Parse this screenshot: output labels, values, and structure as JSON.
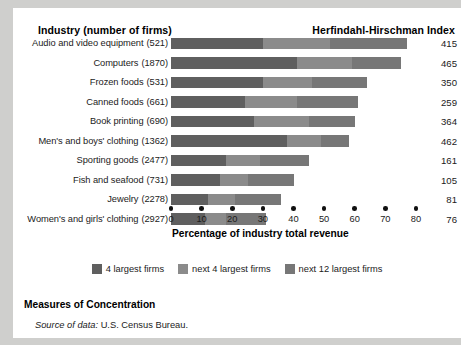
{
  "header": {
    "left_title": "Industry (number of firms)",
    "right_title": "Herfindahl-Hirschman Index"
  },
  "footer": {
    "title": "Measures of Concentration",
    "source_label": "Source of data:",
    "source_value": "U.S. Census Bureau."
  },
  "legend": [
    {
      "label": "4 largest firms",
      "swatch": "s1",
      "color": "#5f5f5f"
    },
    {
      "label": "next 4 largest firms",
      "swatch": "s2",
      "color": "#8b8b8b"
    },
    {
      "label": "next 12 largest firms",
      "swatch": "s3",
      "color": "#777777"
    }
  ],
  "chart_data": {
    "type": "bar",
    "orientation": "horizontal",
    "stacked": true,
    "title": "",
    "xlabel": "Percentage of industry total revenue",
    "ylabel": "",
    "xlim": [
      0,
      80
    ],
    "xticks": [
      0,
      10,
      20,
      30,
      40,
      50,
      60,
      70,
      80
    ],
    "grid": false,
    "legend_position": "bottom-center",
    "categories": [
      "Audio and video equipment",
      "Computers",
      "Frozen foods",
      "Canned foods",
      "Book printing",
      "Men's and boys' clothing",
      "Sporting goods",
      "Fish and seafood",
      "Jewelry",
      "Women's and girls' clothing"
    ],
    "firm_counts": [
      521,
      1870,
      531,
      661,
      690,
      1362,
      2477,
      731,
      2278,
      2927
    ],
    "series": [
      {
        "name": "4 largest firms",
        "values": [
          30,
          41,
          30,
          24,
          27,
          38,
          18,
          16,
          12,
          11
        ]
      },
      {
        "name": "next 4 largest firms",
        "values": [
          22,
          18,
          16,
          17,
          18,
          11,
          11,
          9,
          9,
          7
        ]
      },
      {
        "name": "next 12 largest firms",
        "values": [
          25,
          16,
          18,
          20,
          15,
          9,
          16,
          15,
          15,
          13
        ]
      }
    ],
    "totals": [
      77,
      75,
      64,
      61,
      60,
      58,
      45,
      40,
      36,
      31
    ],
    "hhi_label": "Herfindahl-Hirschman Index",
    "hhi_values": [
      415,
      465,
      350,
      259,
      364,
      462,
      161,
      105,
      81,
      76
    ]
  }
}
